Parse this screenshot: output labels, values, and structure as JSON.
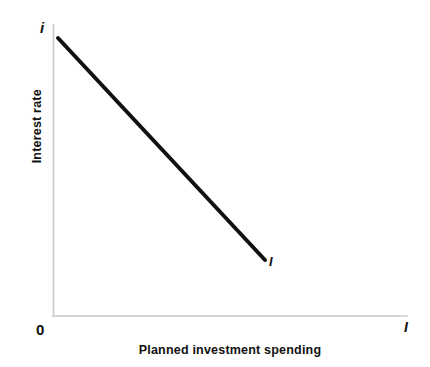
{
  "chart_data": {
    "type": "line",
    "title": "",
    "xlabel": "Planned investment spending",
    "ylabel": "Interest rate",
    "origin_label": "0",
    "y_axis_end_label": "i",
    "x_axis_end_label": "I",
    "grid": false,
    "legend": null,
    "xlim": [
      0,
      1
    ],
    "ylim": [
      0,
      1
    ],
    "axis_tick_labels": {
      "x": [],
      "y": []
    },
    "series": [
      {
        "name": "I",
        "label": "I",
        "kind": "line",
        "color": "#111111",
        "linewidth": 4,
        "annotation": "Investment demand curve: planned investment spending falls as the interest rate rises",
        "points": [
          {
            "x": 0.014,
            "y": 0.955
          },
          {
            "x": 0.599,
            "y": 0.192
          }
        ]
      }
    ],
    "axes_color": "#c9c9c9",
    "background_color": "#ffffff"
  },
  "geometry": {
    "axis_x_left": 53,
    "axis_x_right": 407,
    "axis_y_top": 25,
    "axis_y_bottom": 316,
    "line_start": {
      "x": 58,
      "y": 38
    },
    "line_end": {
      "x": 265,
      "y": 260
    }
  }
}
